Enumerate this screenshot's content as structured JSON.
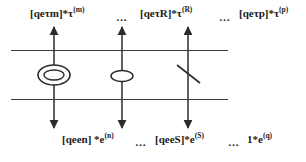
{
  "figure": {
    "background_color": "#ffffff",
    "line_color": "#3a3a3a",
    "text_color": "#1a1a1a"
  },
  "top_labels": [
    {
      "id": "flux-m",
      "base": "[qeτm]*τ",
      "superscript": "(m)",
      "x": 30,
      "y": 7
    },
    {
      "id": "flux-R",
      "base": "[qeτR]*τ",
      "superscript": "(R)",
      "x": 140,
      "y": 7
    },
    {
      "id": "flux-p",
      "base": "[qeτp]*τ",
      "superscript": "(p)",
      "x": 239,
      "y": 7
    }
  ],
  "bottom_labels": [
    {
      "id": "flux-n",
      "base": "[qeen] *e",
      "superscript": "(n)",
      "x": 62,
      "y": 133
    },
    {
      "id": "flux-S",
      "base": "[qeeS]*e",
      "superscript": "(S)",
      "x": 155,
      "y": 133
    },
    {
      "id": "flux-q",
      "base": "1*e",
      "superscript": "(q)",
      "x": 247,
      "y": 133
    }
  ],
  "top_ellipses": [
    {
      "id": "top-ellipsis-1",
      "text": "…",
      "x": 116,
      "y": 11
    },
    {
      "id": "top-ellipsis-2",
      "text": "…",
      "x": 219,
      "y": 11
    }
  ],
  "bottom_ellipses": [
    {
      "id": "bottom-ellipsis-1",
      "text": "…",
      "x": 135,
      "y": 136
    },
    {
      "id": "bottom-ellipsis-2",
      "text": "…",
      "x": 228,
      "y": 136
    }
  ],
  "membranes": [
    {
      "id": "outer-membrane",
      "x": 11,
      "y": 50,
      "width": 217
    },
    {
      "id": "inner-membrane",
      "x": 11,
      "y": 99,
      "width": 217
    }
  ],
  "transport_arrows": [
    {
      "id": "arrow-m-n",
      "x": 54,
      "top": 27,
      "bottom": 128,
      "symbol": "double-ellipse"
    },
    {
      "id": "arrow-R-S",
      "x": 122,
      "top": 27,
      "bottom": 128,
      "symbol": "single-ellipse"
    },
    {
      "id": "arrow-p-q",
      "x": 188,
      "top": 27,
      "bottom": 128,
      "symbol": "blocking-slash"
    }
  ],
  "symbols": {
    "double_ellipse": {
      "cx": 54,
      "cy": 75,
      "outer_rx": 16,
      "outer_ry": 10,
      "inner_rx": 10,
      "inner_ry": 5
    },
    "single_ellipse": {
      "cx": 122,
      "cy": 76,
      "rx": 11,
      "ry": 5.5
    },
    "blocking_slash": {
      "x1": 177,
      "y1": 65,
      "x2": 200,
      "y2": 83
    }
  }
}
